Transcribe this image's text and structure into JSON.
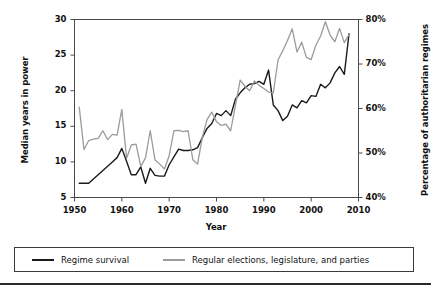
{
  "chart_data": {
    "type": "line",
    "title": "",
    "xlabel": "Year",
    "ylabel": "Median years in power",
    "ylabel_right": "Percentage of authoritarian regimes",
    "grid": false,
    "legend_position": "bottom",
    "xlim": [
      1950,
      2010
    ],
    "ylim": [
      5,
      30
    ],
    "ylim_right": [
      40,
      80
    ],
    "xticks": [
      1950,
      1960,
      1970,
      1980,
      1990,
      2000,
      2010
    ],
    "xticklabels": [
      "1950",
      "1960",
      "1970",
      "1980",
      "1990",
      "2000",
      "2010"
    ],
    "yticks": [
      5,
      10,
      15,
      20,
      25,
      30
    ],
    "yticklabels": [
      "5",
      "10",
      "15",
      "20",
      "25",
      "30"
    ],
    "yticks_right": [
      40,
      50,
      60,
      70,
      80
    ],
    "yticklabels_right": [
      "40%",
      "50%",
      "60%",
      "70%",
      "80%"
    ],
    "x": [
      1951,
      1952,
      1953,
      1954,
      1955,
      1956,
      1957,
      1958,
      1959,
      1960,
      1961,
      1962,
      1963,
      1964,
      1965,
      1966,
      1967,
      1968,
      1969,
      1970,
      1971,
      1972,
      1973,
      1974,
      1975,
      1976,
      1977,
      1978,
      1979,
      1980,
      1981,
      1982,
      1983,
      1984,
      1985,
      1986,
      1987,
      1988,
      1989,
      1990,
      1991,
      1992,
      1993,
      1994,
      1995,
      1996,
      1997,
      1998,
      1999,
      2000,
      2001,
      2002,
      2003,
      2004,
      2005,
      2006,
      2007,
      2008
    ],
    "series": [
      {
        "name": "Regime survival",
        "axis": "left",
        "color": "#1a1a1a",
        "units": "median years in power",
        "values": [
          7.0,
          7.0,
          7.0,
          7.6,
          8.2,
          8.8,
          9.4,
          10.0,
          10.6,
          11.9,
          10.1,
          8.2,
          8.2,
          9.3,
          7.0,
          9.1,
          8.1,
          8.0,
          8.0,
          9.6,
          10.7,
          11.8,
          11.6,
          11.6,
          11.7,
          12.0,
          13.4,
          14.7,
          15.4,
          16.8,
          16.5,
          17.2,
          16.5,
          18.8,
          19.7,
          20.4,
          20.9,
          21.0,
          21.3,
          20.9,
          22.9,
          18.0,
          17.2,
          15.8,
          16.4,
          18.0,
          17.6,
          18.6,
          18.3,
          19.3,
          19.2,
          20.9,
          20.4,
          21.1,
          22.5,
          23.4,
          22.3,
          28.0
        ]
      },
      {
        "name": "Regular elections, legislature, and parties",
        "axis": "right",
        "color": "#9b9b9b",
        "units": "percentage of authoritarian regimes",
        "values": [
          60.3,
          50.8,
          52.8,
          53.1,
          53.3,
          55.0,
          53.0,
          54.2,
          54.0,
          59.8,
          48.8,
          51.8,
          52.0,
          47.0,
          48.9,
          55.0,
          48.5,
          47.5,
          46.4,
          49.4,
          55.0,
          55.1,
          54.8,
          55.0,
          48.5,
          47.5,
          53.5,
          57.5,
          59.2,
          57.0,
          56.2,
          56.5,
          55.0,
          60.7,
          66.4,
          65.0,
          64.0,
          66.2,
          65.2,
          64.5,
          63.7,
          63.5,
          70.9,
          73.0,
          75.3,
          77.9,
          72.7,
          74.9,
          71.5,
          71.0,
          74.2,
          76.3,
          79.5,
          76.5,
          75.0,
          78.0,
          74.8,
          76.6
        ]
      }
    ]
  },
  "legend": {
    "entries": [
      {
        "label": "Regime survival",
        "color": "#1a1a1a"
      },
      {
        "label": "Regular elections, legislature, and parties",
        "color": "#9b9b9b"
      }
    ]
  },
  "axes": {
    "left_title": "Median years in power",
    "right_title": "Percentage of authoritarian regimes",
    "x_title": "Year"
  }
}
